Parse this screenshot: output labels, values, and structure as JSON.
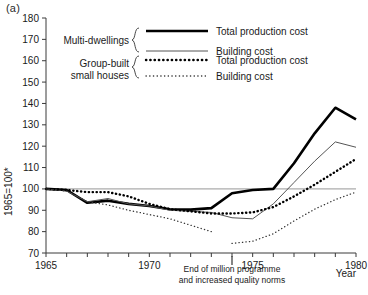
{
  "figure": {
    "panel_label": "(a)"
  },
  "chart_data": {
    "type": "line",
    "title": "",
    "xlabel": "Year",
    "ylabel": "1965=100*",
    "xlim": [
      1965,
      1980
    ],
    "ylim": [
      70,
      180
    ],
    "grid": false,
    "x_ticks": [
      1965,
      1966,
      1967,
      1968,
      1969,
      1970,
      1971,
      1972,
      1973,
      1974,
      1975,
      1976,
      1977,
      1978,
      1979,
      1980
    ],
    "x_tick_labels": [
      "1965",
      "",
      "",
      "",
      "",
      "1970",
      "",
      "",
      "",
      "",
      "1975",
      "",
      "",
      "",
      "",
      "1980"
    ],
    "y_ticks": [
      70,
      80,
      90,
      100,
      110,
      120,
      130,
      140,
      150,
      160,
      170,
      180
    ],
    "y_tick_labels": [
      "70",
      "80",
      "90",
      "100",
      "110",
      "120",
      "130",
      "140",
      "150",
      "160",
      "170",
      "180"
    ],
    "reference_line": 100,
    "legend_position": "upper-left",
    "series": [
      {
        "name": "Total production cost",
        "group": "Multi-dwellings",
        "style": "thick-solid",
        "color": "#000000",
        "x": [
          1965,
          1966,
          1967,
          1968,
          1969,
          1970,
          1971,
          1972,
          1973,
          1974,
          1975,
          1976,
          1977,
          1978,
          1979,
          1980
        ],
        "values": [
          100,
          99.5,
          93.5,
          94.5,
          93,
          92,
          90.5,
          90.3,
          91,
          98,
          99.5,
          100,
          112,
          126,
          138,
          132.5
        ]
      },
      {
        "name": "Building cost",
        "group": "Multi-dwellings",
        "style": "thin-solid",
        "color": "#555555",
        "x": [
          1965,
          1966,
          1967,
          1968,
          1969,
          1970,
          1971,
          1972,
          1973,
          1974,
          1975,
          1976,
          1977,
          1978,
          1979,
          1980
        ],
        "values": [
          100,
          99,
          94,
          95.5,
          93,
          92,
          90,
          89.5,
          89,
          86.5,
          86,
          93,
          103,
          113,
          122,
          119.5
        ]
      },
      {
        "name": "Total production cost",
        "group": "Group-built small houses",
        "style": "thick-dotted",
        "color": "#000000",
        "x": [
          1965,
          1966,
          1967,
          1968,
          1969,
          1970,
          1971,
          1972,
          1973,
          1974,
          1975,
          1976,
          1977,
          1978,
          1979,
          1980
        ],
        "values": [
          100,
          99.5,
          98.5,
          98.5,
          96.5,
          93,
          90.5,
          89.5,
          88.5,
          88.5,
          89,
          91.5,
          96.5,
          102,
          108,
          114
        ]
      },
      {
        "name": "Building cost",
        "group": "Group-built small houses",
        "style": "thin-dotted",
        "color": "#333333",
        "segments": [
          {
            "x": [
              1965,
              1966,
              1967,
              1968,
              1969,
              1970,
              1971,
              1972,
              1973
            ],
            "values": [
              100,
              99,
              94,
              92.5,
              90,
              88,
              86,
              83,
              80
            ]
          },
          {
            "x": [
              1974,
              1975,
              1976,
              1977,
              1978,
              1979,
              1980
            ],
            "values": [
              74.5,
              75.5,
              79,
              85,
              90.5,
              95,
              98.5
            ]
          }
        ]
      }
    ],
    "annotation": {
      "x": 1974,
      "lines": [
        "End of million programme",
        "and increased quality norms"
      ]
    }
  },
  "legend": {
    "groups": [
      {
        "label_lines": [
          "Multi-dwellings"
        ]
      },
      {
        "label_lines": [
          "Group-built",
          "small houses"
        ]
      }
    ],
    "entries": [
      {
        "label": "Total production cost",
        "style": "thick-solid"
      },
      {
        "label": "Building cost",
        "style": "thin-solid"
      },
      {
        "label": "Total production cost",
        "style": "thick-dotted"
      },
      {
        "label": "Building cost",
        "style": "thin-dotted"
      }
    ]
  }
}
